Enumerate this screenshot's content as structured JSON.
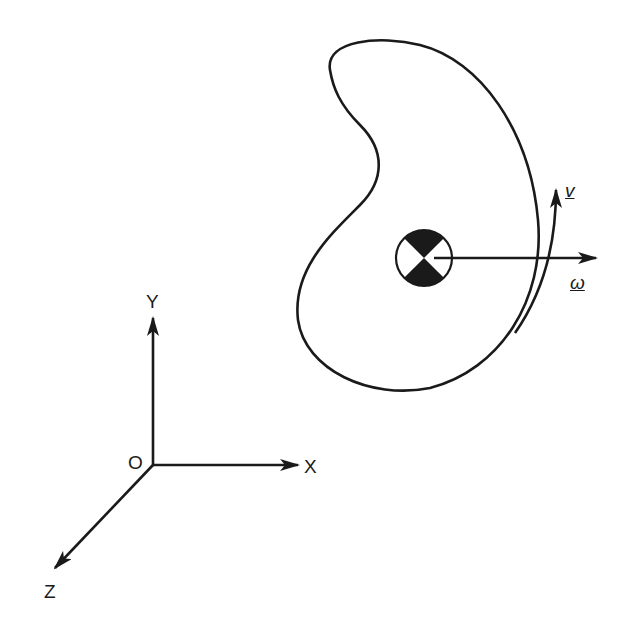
{
  "diagram": {
    "type": "rigid body rotation with coordinate frame",
    "axes": {
      "origin_label": "O",
      "x_label": "X",
      "y_label": "Y",
      "z_label": "Z"
    },
    "body": {
      "shape": "kidney-shaped rigid body",
      "center_marker": "center-of-mass symbol"
    },
    "vectors": {
      "velocity_label": "v",
      "angular_velocity_label": "ω"
    },
    "colors": {
      "stroke": "#1a1a1a",
      "background": "#ffffff"
    }
  }
}
